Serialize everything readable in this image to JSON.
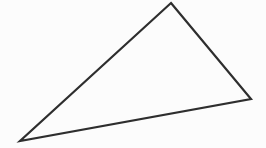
{
  "figure": {
    "name": "triangle-figure",
    "canvas": {
      "width": 266,
      "height": 148,
      "background_color": "#fcfcfc"
    },
    "shape": {
      "type": "triangle",
      "label": "triangle",
      "stroke_color": "#2e2e2e",
      "stroke_width": 2.2,
      "fill_color": "none",
      "vertices": [
        {
          "name": "apex-vertex",
          "x": 171,
          "y": 3
        },
        {
          "name": "right-vertex",
          "x": 251,
          "y": 99
        },
        {
          "name": "left-vertex",
          "x": 20,
          "y": 141
        }
      ],
      "edges": [
        {
          "name": "left-edge",
          "from": "left-vertex",
          "to": "apex-vertex"
        },
        {
          "name": "right-edge",
          "from": "apex-vertex",
          "to": "right-vertex"
        },
        {
          "name": "bottom-edge",
          "from": "right-vertex",
          "to": "left-vertex"
        }
      ],
      "points_string": "171,3 251,99 20,141"
    }
  }
}
